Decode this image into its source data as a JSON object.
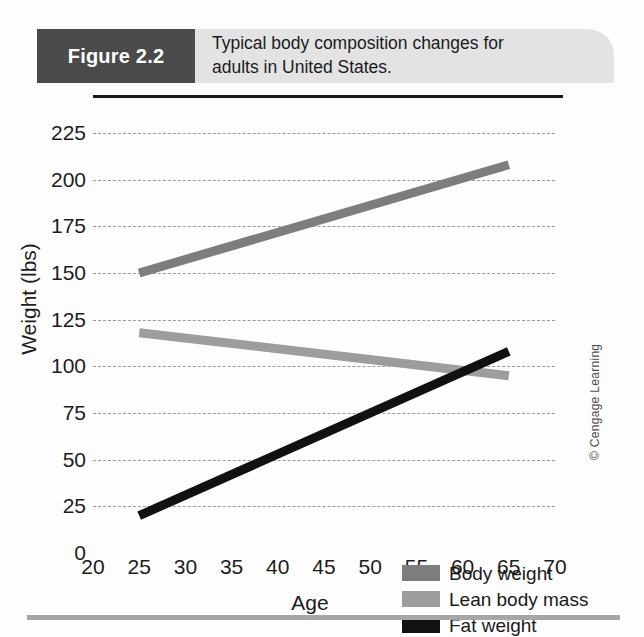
{
  "figure": {
    "tag": "Figure 2.2",
    "caption_line1": "Typical body composition changes for",
    "caption_line2": "adults in United States."
  },
  "credit": "© Cengage Learning",
  "legend": {
    "items": [
      {
        "label": "Body weight",
        "color": "#7d7d7d"
      },
      {
        "label": "Lean body mass",
        "color": "#9d9d9d"
      },
      {
        "label": "Fat weight",
        "color": "#111111"
      }
    ]
  },
  "chart_data": {
    "type": "line",
    "title": "Typical body composition changes for adults in United States.",
    "subtitle": "",
    "xlabel": "Age",
    "ylabel": "Weight (lbs)",
    "xlim": [
      20,
      70
    ],
    "ylim": [
      0,
      225
    ],
    "xticks": [
      20,
      25,
      30,
      35,
      40,
      45,
      50,
      55,
      60,
      65,
      70
    ],
    "yticks": [
      0,
      25,
      50,
      75,
      100,
      125,
      150,
      175,
      200,
      225
    ],
    "xtick_labels": [
      "20",
      "25",
      "30",
      "35",
      "40",
      "45",
      "50",
      "55",
      "60",
      "65",
      "70"
    ],
    "ytick_labels": [
      "0",
      "25",
      "50",
      "75",
      "100",
      "125",
      "150",
      "175",
      "200",
      "225"
    ],
    "grid": "horizontal-dashed",
    "legend_position": "bottom-right",
    "x": [
      25,
      65
    ],
    "series": [
      {
        "name": "Body weight",
        "color": "#7d7d7d",
        "values": [
          150,
          208
        ]
      },
      {
        "name": "Lean body mass",
        "color": "#9d9d9d",
        "values": [
          118,
          95
        ]
      },
      {
        "name": "Fat weight",
        "color": "#111111",
        "values": [
          20,
          108
        ]
      }
    ],
    "annotations": []
  }
}
